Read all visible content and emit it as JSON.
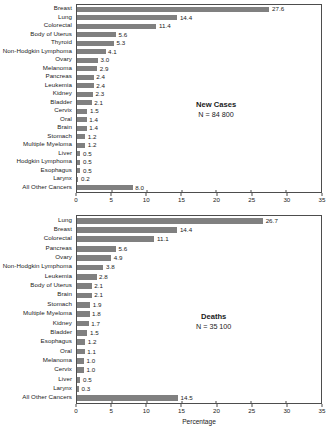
{
  "chart_data": [
    {
      "type": "bar",
      "orientation": "horizontal",
      "panel_id": "new-cases",
      "title": "New Cases",
      "subtitle": "N = 84 800",
      "xlabel": "",
      "ylabel": "",
      "xlim": [
        0,
        35
      ],
      "xticks": [
        0,
        5,
        10,
        15,
        20,
        25,
        30,
        35
      ],
      "xtick_labels": [
        "0",
        "5",
        "10",
        "15",
        "20",
        "25",
        "30",
        "35"
      ],
      "grid": false,
      "bar_color": "#808080",
      "categories": [
        "Breast",
        "Lung",
        "Colorectal",
        "Body of Uterus",
        "Thyroid",
        "Non-Hodgkin Lymphoma",
        "Ovary",
        "Melanoma",
        "Pancreas",
        "Leukemia",
        "Kidney",
        "Bladder",
        "Cervix",
        "Oral",
        "Brain",
        "Stomach",
        "Multiple Myeloma",
        "Liver",
        "Hodgkin Lymphoma",
        "Esophagus",
        "Larynx",
        "All Other Cancers"
      ],
      "values": [
        27.6,
        14.4,
        11.4,
        5.6,
        5.3,
        4.1,
        3.0,
        2.9,
        2.4,
        2.4,
        2.3,
        2.1,
        1.5,
        1.4,
        1.4,
        1.2,
        1.2,
        0.5,
        0.5,
        0.5,
        0.2,
        8.0
      ],
      "value_labels": [
        "27.6",
        "14.4",
        "11.4",
        "5.6",
        "5.3",
        "4.1",
        "3.0",
        "2.9",
        "2.4",
        "2.4",
        "2.3",
        "2.1",
        "1.5",
        "1.4",
        "1.4",
        "1.2",
        "1.2",
        "0.5",
        "0.5",
        "0.5",
        "0.2",
        "8.0"
      ]
    },
    {
      "type": "bar",
      "orientation": "horizontal",
      "panel_id": "deaths",
      "title": "Deaths",
      "subtitle": "N = 35 100",
      "xlabel": "Percentage",
      "ylabel": "",
      "xlim": [
        0,
        35
      ],
      "xticks": [
        0,
        5,
        10,
        15,
        20,
        25,
        30,
        35
      ],
      "xtick_labels": [
        "0",
        "5",
        "10",
        "15",
        "20",
        "25",
        "30",
        "35"
      ],
      "grid": false,
      "bar_color": "#808080",
      "categories": [
        "Lung",
        "Breast",
        "Colorectal",
        "Pancreas",
        "Ovary",
        "Non-Hodgkin Lymphoma",
        "Leukemia",
        "Body of Uterus",
        "Brain",
        "Stomach",
        "Multiple Myeloma",
        "Kidney",
        "Bladder",
        "Esophagus",
        "Oral",
        "Melanoma",
        "Cervix",
        "Liver",
        "Larynx",
        "All Other Cancers"
      ],
      "values": [
        26.7,
        14.4,
        11.1,
        5.6,
        4.9,
        3.8,
        2.8,
        2.1,
        2.1,
        1.9,
        1.8,
        1.7,
        1.5,
        1.2,
        1.1,
        1.0,
        1.0,
        0.5,
        0.3,
        14.5
      ],
      "value_labels": [
        "26.7",
        "14.4",
        "11.1",
        "5.6",
        "4.9",
        "3.8",
        "2.8",
        "2.1",
        "2.1",
        "1.9",
        "1.8",
        "1.7",
        "1.5",
        "1.2",
        "1.1",
        "1.0",
        "1.0",
        "0.5",
        "0.3",
        "14.5"
      ]
    }
  ],
  "axis_title": "Percentage"
}
